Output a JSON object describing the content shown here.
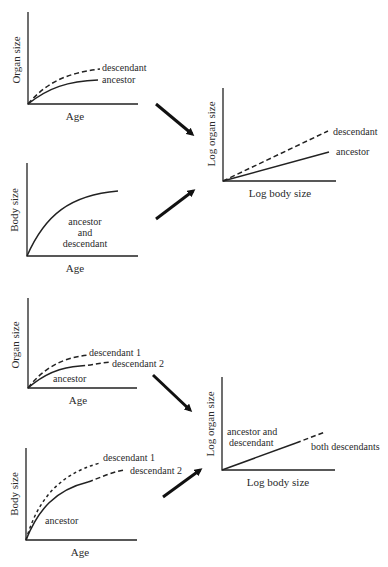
{
  "panels": [
    {
      "id": "organ-age-1",
      "ylabel": "Organ size",
      "xlabel": "Age",
      "labels": [
        "descendant",
        "ancestor"
      ]
    },
    {
      "id": "log-1",
      "ylabel": "Log organ size",
      "xlabel": "Log body size",
      "labels": [
        "descendant",
        "ancestor"
      ]
    },
    {
      "id": "body-age-1",
      "ylabel": "Body size",
      "xlabel": "Age",
      "labels": [
        "ancestor",
        "and",
        "descendant"
      ]
    },
    {
      "id": "organ-age-2",
      "ylabel": "Organ size",
      "xlabel": "Age",
      "labels": [
        "descendant 1",
        "descendant 2",
        "ancestor"
      ]
    },
    {
      "id": "body-age-2",
      "ylabel": "Body size",
      "xlabel": "Age",
      "labels": [
        "descendant 1",
        "descendant 2",
        "ancestor"
      ]
    },
    {
      "id": "log-2",
      "ylabel": "Log organ size",
      "xlabel": "Log body size",
      "labels": [
        "ancestor and",
        "descendant",
        "both descendants"
      ]
    }
  ],
  "colors": {
    "ink": "#222222",
    "background": "#ffffff"
  }
}
